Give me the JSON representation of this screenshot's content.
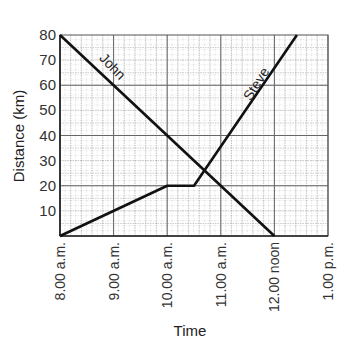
{
  "chart_data": {
    "type": "line",
    "title": "",
    "xlabel": "Time",
    "ylabel": "Distance (km)",
    "x_ticks": [
      "8.00 a.m.",
      "9.00 a.m.",
      "10.00 a.m.",
      "11.00 a.m.",
      "12.00 noon",
      "1.00 p.m."
    ],
    "y_ticks": [
      10,
      20,
      30,
      40,
      50,
      60,
      70,
      80
    ],
    "xlim_hours": [
      8,
      13
    ],
    "ylim": [
      0,
      80
    ],
    "grid": true,
    "series": [
      {
        "name": "John",
        "x_hours": [
          8,
          12
        ],
        "values": [
          80,
          0
        ]
      },
      {
        "name": "Steve",
        "x_hours": [
          8,
          10,
          10.5,
          12.42
        ],
        "values": [
          0,
          20,
          20,
          80
        ]
      }
    ],
    "annotations": [
      {
        "text": "John",
        "near": "John line, ~9:00 a.m. at 65 km"
      },
      {
        "text": "Steve",
        "near": "Steve line, ~11:40 a.m. at 60 km"
      }
    ]
  }
}
